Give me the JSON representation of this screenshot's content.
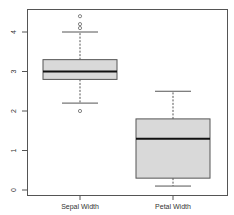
{
  "chart_data": {
    "type": "box",
    "title": "",
    "xlabel": "",
    "ylabel": "",
    "categories": [
      "Sepal Width",
      "Petal Width"
    ],
    "ylim": [
      0,
      4.5
    ],
    "yticks": [
      0,
      1,
      2,
      3,
      4
    ],
    "ytick_labels": [
      "0",
      "1",
      "2",
      "3",
      "4"
    ],
    "grid": false,
    "series": [
      {
        "name": "Sepal Width",
        "min": 2.2,
        "q1": 2.8,
        "median": 3.0,
        "q3": 3.3,
        "max": 4.0,
        "outliers": [
          4.4,
          4.2,
          4.1,
          2.0
        ]
      },
      {
        "name": "Petal Width",
        "min": 0.1,
        "q1": 0.3,
        "median": 1.3,
        "q3": 1.8,
        "max": 2.5,
        "outliers": []
      }
    ],
    "colors": {
      "box_fill": "#d9d9d9",
      "box_stroke": "#555555",
      "median": "#111111",
      "axis": "#555555"
    }
  }
}
